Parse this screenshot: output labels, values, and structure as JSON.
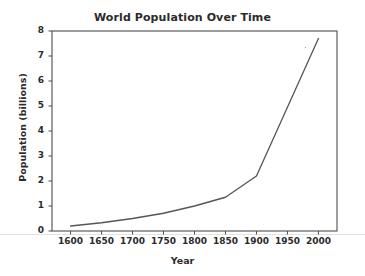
{
  "chart_data": {
    "type": "line",
    "title": "World Population Over Time",
    "xlabel": "Year",
    "ylabel": "Population (billions)",
    "x": [
      1600,
      1650,
      1700,
      1750,
      1800,
      1850,
      1900,
      2000
    ],
    "values": [
      0.2,
      0.33,
      0.5,
      0.71,
      1.0,
      1.35,
      2.2,
      7.7
    ],
    "series": [
      {
        "name": "World Population",
        "values": [
          0.2,
          0.33,
          0.5,
          0.71,
          1.0,
          1.35,
          2.2,
          7.7
        ]
      }
    ],
    "xlim": [
      1570,
      2030
    ],
    "ylim": [
      0,
      8
    ],
    "xticks": [
      1600,
      1650,
      1700,
      1750,
      1800,
      1850,
      1900,
      1950,
      2000
    ],
    "yticks": [
      0,
      1,
      2,
      3,
      4,
      5,
      6,
      7,
      8
    ],
    "xtick_labels": [
      "1600",
      "1650",
      "1700",
      "1750",
      "1800",
      "1850",
      "1900",
      "1950",
      "2000"
    ],
    "ytick_labels": [
      "0",
      "1",
      "2",
      "3",
      "4",
      "5",
      "6",
      "7",
      "8"
    ],
    "grid": false,
    "legend": false,
    "line_color": "#555555",
    "axis_color": "#4d4d4d",
    "background_color": "#ffffff"
  }
}
